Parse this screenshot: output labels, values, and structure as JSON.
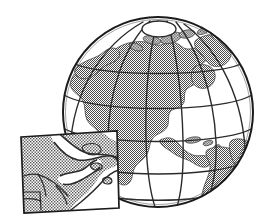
{
  "image": {
    "title": "World globe showing North America with regional map inset",
    "width": 270,
    "height": 224,
    "style": "black line-art clip-art illustration with dithered halftone gray fill",
    "background_color": "#ffffff"
  },
  "colors": {
    "background": "#ffffff",
    "outline": "#1b1b1b",
    "graticule": "#2b2b2b",
    "land_fill": "#8c8c8c",
    "land_fill_light": "#9a9a9a",
    "ocean_fill": "#ffffff",
    "inset_border": "#1b1b1b",
    "inset_land_fill": "#8c8c8c",
    "inset_water_fill": "#ffffff"
  },
  "globe": {
    "name": "earth-globe",
    "projection": "orthographic",
    "center_x": 158,
    "center_y": 112,
    "radius": 95,
    "clipped_at_bottom": true,
    "pole": {
      "name": "north-pole-cap",
      "center_x": 159,
      "center_y": 29,
      "radius_x": 17,
      "radius_y": 8
    },
    "graticule": {
      "meridian_count": 7,
      "parallel_count": 5,
      "line_color": "#2b2b2b",
      "line_width": 1.4
    },
    "landmasses": [
      {
        "name": "north-america",
        "label": "North America"
      },
      {
        "name": "greenland",
        "label": "Greenland"
      },
      {
        "name": "canadian-arctic-islands",
        "label": "Canadian Arctic Archipelago"
      },
      {
        "name": "central-america",
        "label": "Central America"
      },
      {
        "name": "south-america",
        "label": "South America"
      },
      {
        "name": "caribbean-islands",
        "label": "Caribbean Islands"
      }
    ]
  },
  "inset": {
    "name": "regional-map-inset",
    "label": "Regional detail map",
    "region": "Gulf of St. Lawrence / Maritime coastal region",
    "position": {
      "x": 20,
      "y": 133,
      "width": 98,
      "height": 80
    },
    "rotation_deg": -2.5,
    "border_color": "#1b1b1b",
    "border_width": 1.6,
    "features": [
      {
        "name": "mainland-landmass",
        "label": "Mainland"
      },
      {
        "name": "peninsula",
        "label": "Peninsula"
      },
      {
        "name": "island-large",
        "label": "Large island"
      },
      {
        "name": "island-small",
        "label": "Small island"
      },
      {
        "name": "bay-water",
        "label": "Bay"
      },
      {
        "name": "river-line",
        "label": "River"
      },
      {
        "name": "inland-boundary",
        "label": "Inland boundary"
      }
    ]
  }
}
